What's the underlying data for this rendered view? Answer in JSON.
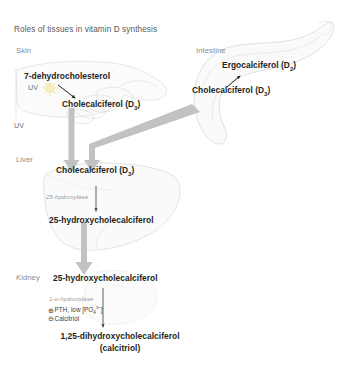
{
  "title": "Roles of tissues in vitamin D synthesis",
  "tissues": {
    "skin": "Skin",
    "intestine": "Intestine",
    "liver": "Liver",
    "kidney": "Kidney"
  },
  "skin_section": {
    "precursor": "7-dehydrocholesterol",
    "uv_label": "UV",
    "product": "Cholecalciferol (D",
    "product_sub": "3",
    "product_tail": ")"
  },
  "intestine_section": {
    "ergocalciferol": "Ergocalciferol (D",
    "ergocalciferol_sub": "2",
    "ergocalciferol_tail": ")",
    "cholecalciferol": "Cholecalciferol (D",
    "cholecalciferol_sub": "3",
    "cholecalciferol_tail": ")"
  },
  "uv_axis_label": "UV",
  "liver_section": {
    "substrate": "Cholecalciferol (D",
    "substrate_sub": "3",
    "substrate_tail": ")",
    "enzyme": "25-hydroxylase",
    "product": "25-hydroxycholecalciferol"
  },
  "kidney_section": {
    "substrate": "25-hydroxycholecalciferol",
    "enzyme": "1-α-hydroxylase",
    "activator_symbol": "⊕",
    "activator": "PTH, low [PO",
    "activator_sub": "4",
    "activator_sup": "3−",
    "activator_tail": "]",
    "inhibitor_symbol": "⊖",
    "inhibitor": "Calcitriol",
    "product": "1,25-dihydroxycholecalciferol",
    "product_alt": "(calcitriol)"
  },
  "colors": {
    "arrow_gray": "#bdbdbd",
    "thin_arrow": "#4d4d4f",
    "organ_outline": "#d6d6d6",
    "organ_fill": "#f3f3f3",
    "sun_yellow": "#f2eab0",
    "text_dark": "#231f20",
    "text_muted": "#8b8b8d"
  },
  "icons": {
    "sun": "sun-icon",
    "hand": "hand-icon",
    "intestine": "intestine-icon",
    "liver": "liver-icon",
    "kidney": "kidney-icon"
  }
}
